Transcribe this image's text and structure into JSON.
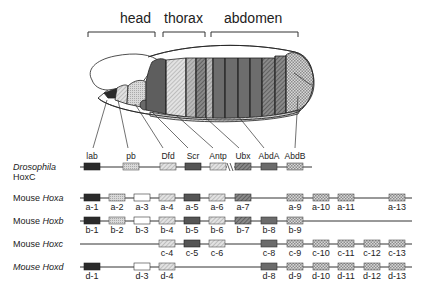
{
  "regions": [
    {
      "label": "head",
      "x": 140,
      "bracket": [
        88,
        155
      ]
    },
    {
      "label": "thorax",
      "x": 172,
      "bracket": [
        163,
        205
      ]
    },
    {
      "label": "abdomen",
      "x": 255,
      "bracket": [
        211,
        298
      ]
    }
  ],
  "rows": {
    "drosophila": {
      "species": "Drosophila",
      "cluster": "HoxC"
    },
    "hoxa": {
      "species": "Mouse",
      "cluster": "Hoxa"
    },
    "hoxb": {
      "species": "Mouse",
      "cluster": "Hoxb"
    },
    "hoxc": {
      "species": "Mouse",
      "cluster": "Hoxc"
    },
    "hoxd": {
      "species": "Mouse",
      "cluster": "Hoxd"
    }
  },
  "drosophila_genes": [
    "lab",
    "pb",
    "Dfd",
    "Scr",
    "Antp",
    "Ubx",
    "AbdA",
    "AbdB"
  ],
  "mouse_genes": {
    "hoxa": [
      "a-1",
      "a-2",
      "a-3",
      "a-4",
      "a-5",
      "a-6",
      "a-7",
      "a-9",
      "a-10",
      "a-11",
      "a-13"
    ],
    "hoxb": [
      "b-1",
      "b-2",
      "b-3",
      "b-4",
      "b-5",
      "b-6",
      "b-7",
      "b-8",
      "b-9"
    ],
    "hoxc": [
      "c-4",
      "c-5",
      "c-6",
      "c-8",
      "c-9",
      "c-10",
      "c-11",
      "c-12",
      "c-13"
    ],
    "hoxd": [
      "d-1",
      "d-3",
      "d-4",
      "d-8",
      "d-9",
      "d-10",
      "d-11",
      "d-12",
      "d-13"
    ]
  },
  "colors": {
    "line": "#333333",
    "lab": "#2b2b2b",
    "pb": "#d6d6d6",
    "group3": "#ffffff",
    "Dfd": "#c4c4c4",
    "Scr": "#5a5a5a",
    "Antp": "#bdbdbd",
    "Ubx": "#7a7a7a",
    "AbdA": "#6b6b6b",
    "AbdB": "#cfcfcf"
  }
}
